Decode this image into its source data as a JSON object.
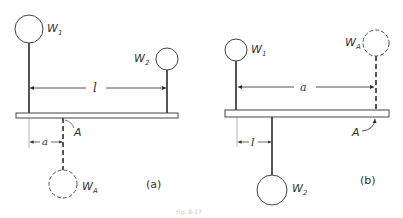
{
  "figure": {
    "caption": "Fig. 8-17",
    "colors": {
      "stroke": "#2a2a2a",
      "text": "#333333",
      "beam_fill": "#ffffff"
    }
  },
  "panels": [
    {
      "id": "a",
      "label": "(a)",
      "label_pos": [
        154,
        188
      ],
      "beam": {
        "x": 16,
        "y": 113,
        "w": 162,
        "h": 5
      },
      "masses": [
        {
          "name": "W",
          "sub": "1",
          "cx": 29,
          "cy": 29,
          "r": 14,
          "dashed": false,
          "rod_from": 43,
          "rod_to": 113,
          "rod_x": 29,
          "label_pos": [
            47,
            30
          ]
        },
        {
          "name": "W",
          "sub": "2",
          "cx": 167,
          "cy": 59,
          "r": 11,
          "dashed": false,
          "rod_from": 70,
          "rod_to": 113,
          "rod_x": 167,
          "label_pos": [
            133,
            64
          ]
        },
        {
          "name": "W",
          "sub": "A",
          "cx": 63,
          "cy": 184,
          "r": 14,
          "dashed": true,
          "rod_from": 118,
          "rod_to": 170,
          "rod_x": 63,
          "label_pos": [
            82,
            190
          ]
        }
      ],
      "point_A": {
        "label": "A",
        "label_pos": [
          75,
          134
        ]
      },
      "dimensions": [
        {
          "label": "l",
          "x1": 29,
          "x2": 167,
          "y": 88,
          "label_x": 95
        },
        {
          "label": "a",
          "x1": 29,
          "x2": 63,
          "y": 142,
          "label_x": 44,
          "ext_from": 118,
          "ext_to": 148
        }
      ]
    },
    {
      "id": "b",
      "label": "(b)",
      "label_pos": [
        363,
        184
      ],
      "beam": {
        "x": 225,
        "y": 110,
        "w": 164,
        "h": 7
      },
      "masses": [
        {
          "name": "W",
          "sub": "1",
          "cx": 236,
          "cy": 50,
          "r": 11,
          "dashed": false,
          "rod_from": 61,
          "rod_to": 110,
          "rod_x": 236,
          "label_pos": [
            251,
            55
          ]
        },
        {
          "name": "W",
          "sub": "A",
          "cx": 375,
          "cy": 43,
          "r": 13,
          "dashed": true,
          "rod_from": 56,
          "rod_to": 110,
          "rod_x": 375,
          "label_pos": [
            344,
            45
          ]
        },
        {
          "name": "W",
          "sub": "2",
          "cx": 272,
          "cy": 190,
          "r": 15,
          "dashed": false,
          "rod_from": 117,
          "rod_to": 175,
          "rod_x": 272,
          "label_pos": [
            292,
            192
          ]
        }
      ],
      "point_A": {
        "label": "A",
        "label_pos": [
          354,
          136
        ]
      },
      "dimensions": [
        {
          "label": "a",
          "x1": 236,
          "x2": 375,
          "y": 87,
          "label_x": 301
        },
        {
          "label": "l",
          "x1": 237,
          "x2": 272,
          "y": 142,
          "label_x": 252,
          "ext_from": 117,
          "ext_to": 147
        }
      ]
    }
  ],
  "text": {
    "panel_a_label": "(a)",
    "panel_b_label": "(b)",
    "a_W1": "W",
    "a_W1_sub": "1",
    "a_W2": "W",
    "a_W2_sub": "2",
    "a_WA": "W",
    "a_WA_sub": "A",
    "a_A": "A",
    "a_dim_l": "l",
    "a_dim_a": "a",
    "b_W1": "W",
    "b_W1_sub": "1",
    "b_WA": "W",
    "b_WA_sub": "A",
    "b_W2": "W",
    "b_W2_sub": "2",
    "b_A": "A",
    "b_dim_a": "a",
    "b_dim_l": "l"
  }
}
